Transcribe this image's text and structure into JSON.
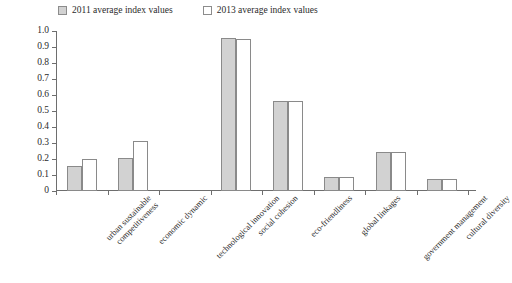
{
  "legend": {
    "position": "top",
    "entries": [
      {
        "label": "2011 average index values",
        "swatch": "filled-gray-square",
        "color": "#d2d2d2"
      },
      {
        "label": "2013 average index values",
        "swatch": "open-white-square",
        "color": "#ffffff"
      }
    ]
  },
  "axis": {
    "y_ticks": [
      "0",
      "0.1",
      "0.2",
      "0.3",
      "0.4",
      "0.5",
      "0.6",
      "0.7",
      "0.8",
      "0.9",
      "1.0"
    ]
  },
  "chart_data": {
    "type": "bar",
    "title": "",
    "subtitle": "",
    "xlabel": "",
    "ylabel": "",
    "ylim": [
      0,
      1.0
    ],
    "ytick_step": 0.1,
    "grid": false,
    "legend_position": "top",
    "categories": [
      "urban sustainable competitiveness",
      "economic dynamic",
      "technological innovation",
      "social cohesion",
      "eco-friendliness",
      "global linkages",
      "government management",
      "cultural diversity"
    ],
    "category_lines": [
      [
        "urban sustainable",
        "competitiveness"
      ],
      [
        "economic dynamic"
      ],
      [
        "technological innovation"
      ],
      [
        "social cohesion"
      ],
      [
        "eco-friendliness"
      ],
      [
        "global linkages"
      ],
      [
        "government management"
      ],
      [
        "cultural diversity"
      ]
    ],
    "series": [
      {
        "name": "2011 average index values",
        "color": "#d2d2d2",
        "values": [
          0.155,
          0.205,
          0.0,
          0.955,
          0.56,
          0.085,
          0.245,
          0.078
        ]
      },
      {
        "name": "2013 average index values",
        "color": "#ffffff",
        "values": [
          0.2,
          0.315,
          0.0,
          0.948,
          0.56,
          0.085,
          0.245,
          0.078
        ]
      }
    ]
  }
}
